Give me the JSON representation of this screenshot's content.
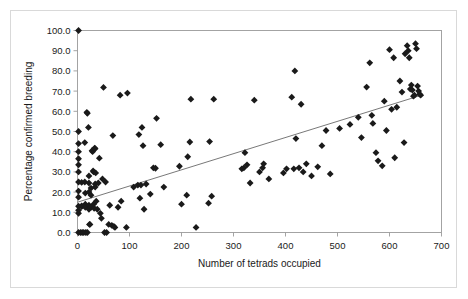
{
  "chart_data": {
    "type": "scatter",
    "title": "",
    "xlabel": "Number of tetrads occupied",
    "ylabel": "Percentage confirmed breeding",
    "xlim": [
      0,
      700
    ],
    "ylim": [
      0,
      100
    ],
    "xticks": [
      0,
      100,
      200,
      300,
      400,
      500,
      600,
      700
    ],
    "xtick_labels": [
      "0",
      "100",
      "200",
      "300",
      "400",
      "500",
      "600",
      "700"
    ],
    "yticks": [
      0,
      10,
      20,
      30,
      40,
      50,
      60,
      70,
      80,
      90,
      100
    ],
    "ytick_labels": [
      "0.0",
      "10.0",
      "20.0",
      "30.0",
      "40.0",
      "50.0",
      "60.0",
      "70.0",
      "80.0",
      "90.0",
      "100.0"
    ],
    "grid": false,
    "legend": "none",
    "marker": "diamond",
    "marker_color": "#1a1a1a",
    "marker_size": 4.2,
    "trendline": {
      "type": "linear",
      "x_start": 0,
      "y_start": 15.0,
      "x_end": 662,
      "y_end": 68.0,
      "color": "#555555",
      "width": 0.8
    },
    "points": [
      [
        2,
        100.0
      ],
      [
        2,
        50.0
      ],
      [
        2,
        44.0
      ],
      [
        2,
        40.0
      ],
      [
        2,
        36.5
      ],
      [
        2,
        33.5
      ],
      [
        2,
        30.0
      ],
      [
        2,
        25.0
      ],
      [
        2,
        20.5
      ],
      [
        2,
        17.5
      ],
      [
        2,
        13.0
      ],
      [
        2,
        11.0
      ],
      [
        2,
        9.5
      ],
      [
        2,
        0.0
      ],
      [
        6,
        0.0
      ],
      [
        8,
        24.8
      ],
      [
        8,
        13.2
      ],
      [
        8,
        12.8
      ],
      [
        9,
        0.0
      ],
      [
        12,
        0.0
      ],
      [
        14,
        44.5
      ],
      [
        14,
        25.0
      ],
      [
        15,
        19.5
      ],
      [
        15,
        14.0
      ],
      [
        15,
        12.5
      ],
      [
        16,
        0.0
      ],
      [
        18,
        59.5
      ],
      [
        19,
        59.0
      ],
      [
        19,
        0.0
      ],
      [
        21,
        52.0
      ],
      [
        22,
        28.0
      ],
      [
        22,
        24.5
      ],
      [
        22,
        20.0
      ],
      [
        22,
        13.5
      ],
      [
        22,
        11.5
      ],
      [
        23,
        4.0
      ],
      [
        24,
        4.0
      ],
      [
        26,
        22.0
      ],
      [
        26,
        18.5
      ],
      [
        26,
        12.5
      ],
      [
        28,
        40.5
      ],
      [
        29,
        40.0
      ],
      [
        30,
        30.5
      ],
      [
        31,
        30.0
      ],
      [
        31,
        14.0
      ],
      [
        32,
        12.0
      ],
      [
        33,
        41.8
      ],
      [
        34,
        41.5
      ],
      [
        34,
        24.0
      ],
      [
        34,
        22.5
      ],
      [
        35,
        29.5
      ],
      [
        36,
        15.5
      ],
      [
        38,
        11.5
      ],
      [
        40,
        24.5
      ],
      [
        42,
        36.8
      ],
      [
        44,
        9.5
      ],
      [
        46,
        7.0
      ],
      [
        48,
        26.5
      ],
      [
        50,
        71.8
      ],
      [
        52,
        0.0
      ],
      [
        54,
        25.0
      ],
      [
        56,
        0.0
      ],
      [
        60,
        4.0
      ],
      [
        62,
        13.5
      ],
      [
        66,
        3.5
      ],
      [
        68,
        48.0
      ],
      [
        70,
        3.0
      ],
      [
        72,
        2.5
      ],
      [
        78,
        12.5
      ],
      [
        82,
        68.0
      ],
      [
        84,
        15.5
      ],
      [
        94,
        2.5
      ],
      [
        96,
        69.0
      ],
      [
        108,
        22.5
      ],
      [
        116,
        23.5
      ],
      [
        118,
        48.5
      ],
      [
        120,
        17.0
      ],
      [
        122,
        23.5
      ],
      [
        124,
        52.0
      ],
      [
        126,
        43.0
      ],
      [
        128,
        11.5
      ],
      [
        132,
        24.0
      ],
      [
        140,
        19.0
      ],
      [
        146,
        32.0
      ],
      [
        150,
        31.8
      ],
      [
        152,
        56.5
      ],
      [
        160,
        43.5
      ],
      [
        166,
        22.5
      ],
      [
        196,
        32.8
      ],
      [
        200,
        14.0
      ],
      [
        210,
        18.5
      ],
      [
        212,
        37.5
      ],
      [
        216,
        44.8
      ],
      [
        218,
        66.0
      ],
      [
        228,
        2.5
      ],
      [
        252,
        14.5
      ],
      [
        254,
        45.0
      ],
      [
        258,
        18.0
      ],
      [
        262,
        66.0
      ],
      [
        316,
        31.5
      ],
      [
        320,
        32.0
      ],
      [
        322,
        39.5
      ],
      [
        326,
        33.5
      ],
      [
        332,
        24.5
      ],
      [
        340,
        65.5
      ],
      [
        350,
        30.0
      ],
      [
        356,
        32.0
      ],
      [
        358,
        34.0
      ],
      [
        368,
        26.5
      ],
      [
        396,
        29.5
      ],
      [
        402,
        31.5
      ],
      [
        412,
        67.0
      ],
      [
        416,
        31.5
      ],
      [
        418,
        80.0
      ],
      [
        420,
        46.5
      ],
      [
        426,
        32.0
      ],
      [
        430,
        63.5
      ],
      [
        434,
        30.0
      ],
      [
        440,
        34.0
      ],
      [
        450,
        28.0
      ],
      [
        462,
        32.5
      ],
      [
        470,
        43.0
      ],
      [
        478,
        50.5
      ],
      [
        486,
        29.0
      ],
      [
        504,
        51.5
      ],
      [
        524,
        53.5
      ],
      [
        540,
        57.0
      ],
      [
        546,
        47.0
      ],
      [
        556,
        72.0
      ],
      [
        562,
        84.0
      ],
      [
        566,
        58.0
      ],
      [
        568,
        54.0
      ],
      [
        574,
        39.5
      ],
      [
        578,
        35.5
      ],
      [
        586,
        33.0
      ],
      [
        590,
        65.0
      ],
      [
        594,
        50.5
      ],
      [
        600,
        90.5
      ],
      [
        604,
        61.0
      ],
      [
        608,
        86.5
      ],
      [
        610,
        37.0
      ],
      [
        614,
        62.0
      ],
      [
        620,
        75.0
      ],
      [
        624,
        69.5
      ],
      [
        628,
        44.5
      ],
      [
        630,
        88.5
      ],
      [
        634,
        92.5
      ],
      [
        636,
        90.0
      ],
      [
        638,
        86.5
      ],
      [
        640,
        71.0
      ],
      [
        642,
        73.0
      ],
      [
        644,
        70.5
      ],
      [
        646,
        67.5
      ],
      [
        648,
        68.0
      ],
      [
        650,
        93.5
      ],
      [
        652,
        91.0
      ],
      [
        654,
        72.5
      ],
      [
        656,
        70.0
      ],
      [
        658,
        68.5
      ],
      [
        660,
        68.0
      ]
    ]
  }
}
